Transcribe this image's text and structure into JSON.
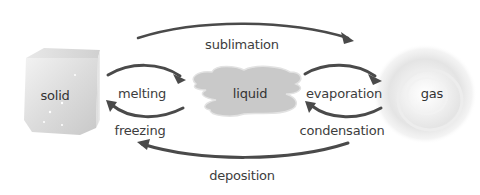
{
  "diagram": {
    "title": "",
    "colors": {
      "arrow": "#4a4a4a",
      "text": "#3d3d3d",
      "liquid_fill": "#c9c9c9",
      "solid_fill": "#e0e0e0",
      "gas_fill": "#e6e6e6"
    },
    "states": {
      "solid": {
        "label": "solid",
        "icon": "ice-cube-icon"
      },
      "liquid": {
        "label": "liquid",
        "icon": "liquid-puddle-icon"
      },
      "gas": {
        "label": "gas",
        "icon": "gas-cloud-icon"
      }
    },
    "transitions": {
      "sublimation": {
        "label": "sublimation",
        "from": "solid",
        "to": "gas"
      },
      "melting": {
        "label": "melting",
        "from": "solid",
        "to": "liquid"
      },
      "freezing": {
        "label": "freezing",
        "from": "liquid",
        "to": "solid"
      },
      "evaporation": {
        "label": "evaporation",
        "from": "liquid",
        "to": "gas"
      },
      "condensation": {
        "label": "condensation",
        "from": "gas",
        "to": "liquid"
      },
      "deposition": {
        "label": "deposition",
        "from": "gas",
        "to": "solid"
      }
    }
  }
}
